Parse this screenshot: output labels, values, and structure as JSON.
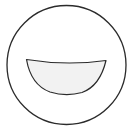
{
  "figure": {
    "colors": {
      "background": "#ffffff",
      "stroke": "#2b2b2b",
      "mouth_fill": "#f2f2f2"
    }
  }
}
